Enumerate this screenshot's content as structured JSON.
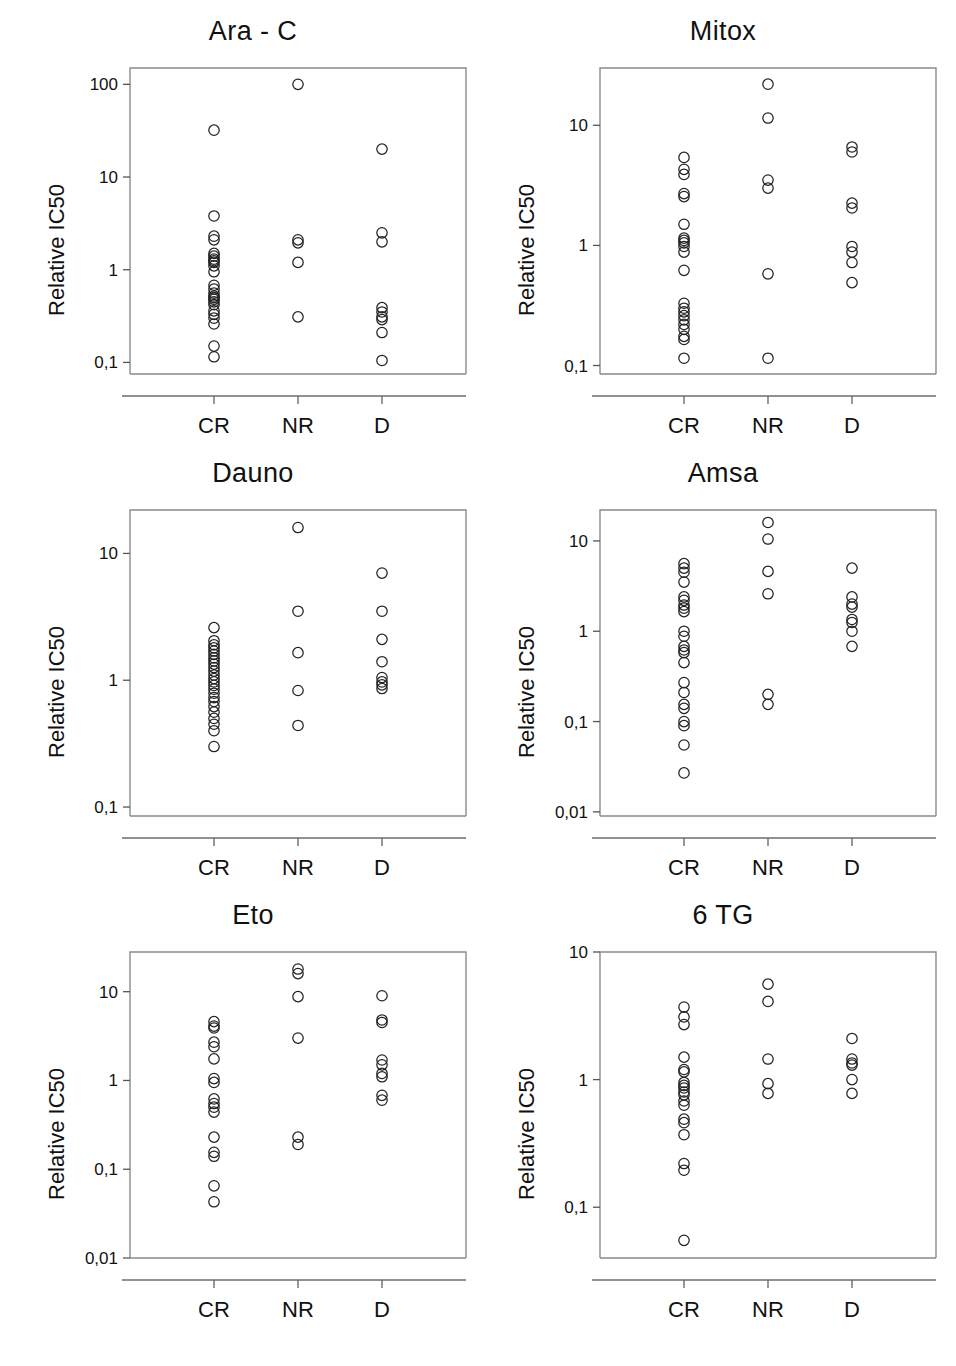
{
  "figure": {
    "axis_label": "Relative IC50",
    "groups": [
      "CR",
      "NR",
      "D"
    ],
    "marker": "open-circle",
    "marker_color": "#222222",
    "frame_color": "#777777",
    "background": "#ffffff"
  },
  "chart_data": [
    {
      "type": "scatter",
      "title": "Ara - C",
      "xlabel": "",
      "ylabel": "Relative IC50",
      "yscale": "log",
      "ylim": [
        0.075,
        150
      ],
      "yticks": [
        0.1,
        1,
        10,
        100
      ],
      "ytick_labels": [
        "0,1",
        "1",
        "10",
        "100"
      ],
      "categories": [
        "CR",
        "NR",
        "D"
      ],
      "grid": false,
      "legend": "none",
      "series": [
        {
          "name": "CR",
          "values": [
            32,
            3.8,
            2.3,
            2.1,
            1.5,
            1.4,
            1.3,
            1.25,
            1.2,
            1.1,
            0.95,
            0.68,
            0.62,
            0.56,
            0.52,
            0.5,
            0.48,
            0.45,
            0.42,
            0.36,
            0.33,
            0.3,
            0.26,
            0.15,
            0.115
          ]
        },
        {
          "name": "NR",
          "values": [
            100,
            2.1,
            1.95,
            1.2,
            0.31
          ]
        },
        {
          "name": "D",
          "values": [
            20,
            2.5,
            2.0,
            0.39,
            0.35,
            0.31,
            0.29,
            0.21,
            0.105
          ]
        }
      ]
    },
    {
      "type": "scatter",
      "title": "Mitox",
      "xlabel": "",
      "ylabel": "Relative IC50",
      "yscale": "log",
      "ylim": [
        0.085,
        30
      ],
      "yticks": [
        0.1,
        1,
        10
      ],
      "ytick_labels": [
        "0,1",
        "1",
        "10"
      ],
      "categories": [
        "CR",
        "NR",
        "D"
      ],
      "grid": false,
      "legend": "none",
      "series": [
        {
          "name": "CR",
          "values": [
            5.4,
            4.3,
            3.9,
            2.7,
            2.55,
            1.5,
            1.15,
            1.1,
            1.05,
            0.98,
            0.88,
            0.62,
            0.33,
            0.3,
            0.28,
            0.26,
            0.24,
            0.22,
            0.2,
            0.175,
            0.165,
            0.115
          ]
        },
        {
          "name": "NR",
          "values": [
            22,
            11.5,
            3.5,
            3.0,
            0.58,
            0.115
          ]
        },
        {
          "name": "D",
          "values": [
            6.6,
            6.0,
            2.25,
            2.05,
            0.98,
            0.88,
            0.72,
            0.49
          ]
        }
      ]
    },
    {
      "type": "scatter",
      "title": "Dauno",
      "xlabel": "",
      "ylabel": "Relative IC50",
      "yscale": "log",
      "ylim": [
        0.085,
        22
      ],
      "yticks": [
        0.1,
        1,
        10
      ],
      "ytick_labels": [
        "0,1",
        "1",
        "10"
      ],
      "categories": [
        "CR",
        "NR",
        "D"
      ],
      "grid": false,
      "legend": "none",
      "series": [
        {
          "name": "CR",
          "values": [
            2.6,
            2.05,
            1.9,
            1.8,
            1.7,
            1.6,
            1.5,
            1.42,
            1.34,
            1.26,
            1.18,
            1.1,
            1.03,
            0.97,
            0.91,
            0.85,
            0.79,
            0.73,
            0.68,
            0.62,
            0.56,
            0.5,
            0.45,
            0.4,
            0.3
          ]
        },
        {
          "name": "NR",
          "values": [
            16,
            3.5,
            1.65,
            0.83,
            0.44
          ]
        },
        {
          "name": "D",
          "values": [
            7.0,
            3.5,
            2.1,
            1.4,
            1.05,
            0.97,
            0.92,
            0.86
          ]
        }
      ]
    },
    {
      "type": "scatter",
      "title": "Amsa",
      "xlabel": "",
      "ylabel": "Relative IC50",
      "yscale": "log",
      "ylim": [
        0.009,
        22
      ],
      "yticks": [
        0.01,
        0.1,
        1,
        10
      ],
      "ytick_labels": [
        "0,01",
        "0,1",
        "1",
        "10"
      ],
      "categories": [
        "CR",
        "NR",
        "D"
      ],
      "grid": false,
      "legend": "none",
      "series": [
        {
          "name": "CR",
          "values": [
            5.6,
            5.0,
            4.5,
            3.5,
            2.4,
            2.2,
            1.95,
            1.8,
            1.65,
            1.0,
            0.88,
            0.68,
            0.62,
            0.58,
            0.45,
            0.27,
            0.21,
            0.155,
            0.14,
            0.1,
            0.09,
            0.055,
            0.027
          ]
        },
        {
          "name": "NR",
          "values": [
            16,
            10.5,
            4.6,
            2.6,
            0.2,
            0.155
          ]
        },
        {
          "name": "D",
          "values": [
            5.0,
            2.4,
            2.0,
            1.85,
            1.35,
            1.25,
            1.0,
            0.68
          ]
        }
      ]
    },
    {
      "type": "scatter",
      "title": "Eto",
      "xlabel": "",
      "ylabel": "Relative IC50",
      "yscale": "log",
      "ylim": [
        0.01,
        28
      ],
      "yticks": [
        0.01,
        0.1,
        1,
        10
      ],
      "ytick_labels": [
        "0,01",
        "0,1",
        "1",
        "10"
      ],
      "categories": [
        "CR",
        "NR",
        "D"
      ],
      "grid": false,
      "legend": "none",
      "series": [
        {
          "name": "CR",
          "values": [
            4.6,
            4.1,
            3.9,
            2.7,
            2.4,
            1.75,
            1.05,
            0.95,
            0.62,
            0.55,
            0.5,
            0.44,
            0.23,
            0.155,
            0.14,
            0.065,
            0.043
          ]
        },
        {
          "name": "NR",
          "values": [
            18,
            16,
            8.8,
            3.0,
            0.23,
            0.19
          ]
        },
        {
          "name": "D",
          "values": [
            9.0,
            4.8,
            4.5,
            1.7,
            1.5,
            1.2,
            1.1,
            0.68,
            0.6
          ]
        }
      ]
    },
    {
      "type": "scatter",
      "title": "6 TG",
      "xlabel": "",
      "ylabel": "Relative IC50",
      "yscale": "log",
      "ylim": [
        0.04,
        10
      ],
      "yticks": [
        0.1,
        1,
        10
      ],
      "ytick_labels": [
        "0,1",
        "1",
        "10"
      ],
      "categories": [
        "CR",
        "NR",
        "D"
      ],
      "grid": false,
      "legend": "none",
      "series": [
        {
          "name": "CR",
          "values": [
            3.7,
            3.1,
            2.7,
            1.5,
            1.2,
            1.15,
            0.95,
            0.9,
            0.86,
            0.8,
            0.76,
            0.68,
            0.63,
            0.49,
            0.46,
            0.37,
            0.22,
            0.195,
            0.055
          ]
        },
        {
          "name": "NR",
          "values": [
            5.6,
            4.1,
            1.45,
            0.93,
            0.78
          ]
        },
        {
          "name": "D",
          "values": [
            2.1,
            1.45,
            1.35,
            1.3,
            1.0,
            0.78
          ]
        }
      ]
    }
  ]
}
